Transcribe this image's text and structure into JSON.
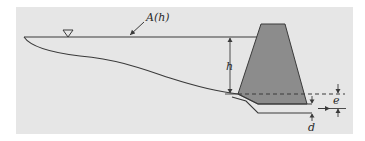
{
  "diagram": {
    "type": "reservoir-dam cross-section",
    "colors": {
      "panel_background": "#e6e6e6",
      "page_background": "#ffffff",
      "dam_fill": "#8c8c8c",
      "line": "#3a3a3a",
      "label": "#2a2a2a"
    },
    "labels": {
      "surface_area": "A(h)",
      "head": "h",
      "offset": "e",
      "outlet_diameter": "d"
    },
    "symbols": {
      "water_surface": "inverted-triangle",
      "flow_direction": "arrow-right"
    },
    "elements": [
      "water surface line",
      "reservoir bed profile",
      "trapezoidal dam",
      "outlet pipe",
      "dashed reference line",
      "dimension h",
      "dimension e",
      "dimension d"
    ]
  }
}
